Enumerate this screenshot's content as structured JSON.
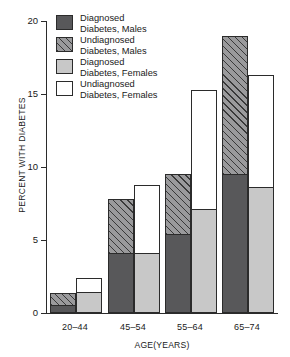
{
  "chart_data": {
    "type": "bar",
    "title": "",
    "xlabel": "AGE(YEARS)",
    "ylabel": "PERCENT WITH DIABETES",
    "ylim": [
      0,
      20
    ],
    "yticks": [
      0,
      5,
      10,
      15,
      20
    ],
    "grid": false,
    "legend_position": "upper-left",
    "stacked": true,
    "categories": [
      "20–44",
      "45–54",
      "55–64",
      "65–74"
    ],
    "series": [
      {
        "name": "Diagnosed Diabetes, Males",
        "key": "diag_m",
        "fill": "dark-gray",
        "values": [
          0.6,
          4.2,
          5.5,
          9.6
        ]
      },
      {
        "name": "Undiagnosed Diabetes, Males",
        "key": "undiag_m",
        "fill": "hatched",
        "values": [
          0.8,
          3.6,
          4.0,
          9.4
        ]
      },
      {
        "name": "Diagnosed Diabetes, Females",
        "key": "diag_f",
        "fill": "light-gray",
        "values": [
          1.5,
          4.2,
          7.2,
          8.7
        ]
      },
      {
        "name": "Undiagnosed Diabetes, Females",
        "key": "undiag_f",
        "fill": "white",
        "values": [
          0.9,
          4.6,
          8.1,
          7.6
        ]
      }
    ],
    "totals": {
      "males": [
        1.4,
        7.8,
        9.5,
        19.0
      ],
      "females": [
        2.4,
        8.8,
        15.3,
        16.3
      ]
    }
  },
  "axes": {
    "y_title": "PERCENT WITH DIABETES",
    "x_title": "AGE(YEARS)",
    "y_tick_labels": [
      "20",
      "15",
      "10",
      "5",
      "0"
    ],
    "x_tick_labels": [
      "20–44",
      "45–54",
      "55–64",
      "65–74"
    ]
  },
  "legend": {
    "items": [
      {
        "label_line1": "Diagnosed",
        "label_line2": "Diabetes, Males",
        "swatch": "dark-gray-swatch"
      },
      {
        "label_line1": "Undiagnosed",
        "label_line2": "Diabetes, Males",
        "swatch": "hatched-swatch"
      },
      {
        "label_line1": "Diagnosed",
        "label_line2": "Diabetes, Females",
        "swatch": "light-gray-swatch"
      },
      {
        "label_line1": "Undiagnosed",
        "label_line2": "Diabetes, Females",
        "swatch": "white-swatch"
      }
    ]
  },
  "colors": {
    "dark_gray": "#58585a",
    "light_gray": "#c8c8c8",
    "white": "#ffffff",
    "hatch_base": "#9a9a9c",
    "axis": "#2b2b2b"
  }
}
